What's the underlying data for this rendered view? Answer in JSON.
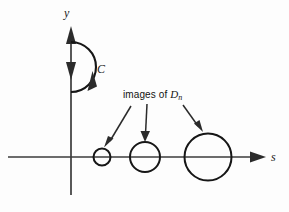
{
  "figure": {
    "kind": "complex-plane-contour-diagram",
    "background_color": "#fdfdfd",
    "ink_color": "#161616",
    "axes": {
      "vertical_label": "y",
      "horizontal_label": "s",
      "origin": {
        "x": 71,
        "y": 157
      },
      "vertical_extent": {
        "top": 26,
        "bottom": 195
      },
      "horizontal_extent": {
        "left": 8,
        "right": 266
      }
    },
    "contour": {
      "label": "C",
      "description": "closed contour: segment of the y-axis with downward arrow plus right-bulging semicircular arc with upward arrow",
      "arc_top": {
        "x": 71,
        "y": 42
      },
      "arc_bottom": {
        "x": 71,
        "y": 92
      },
      "arc_rightmost_x": 95
    },
    "annotation": {
      "text_prefix": "images of ",
      "variable": "D",
      "subscript": "n",
      "full_text": "images of Dn",
      "leaders": [
        {
          "from": {
            "x": 131,
            "y": 106
          },
          "to": {
            "x": 107,
            "y": 146
          }
        },
        {
          "from": {
            "x": 147,
            "y": 104
          },
          "to": {
            "x": 145,
            "y": 140
          }
        },
        {
          "from": {
            "x": 183,
            "y": 105
          },
          "to": {
            "x": 202,
            "y": 131
          }
        }
      ]
    },
    "image_circles": [
      {
        "name": "small-image-circle",
        "cx": 102,
        "cy": 157,
        "r": 8.5
      },
      {
        "name": "medium-image-circle",
        "cx": 145,
        "cy": 157,
        "r": 15.0
      },
      {
        "name": "large-image-circle",
        "cx": 208,
        "cy": 157,
        "r": 23.5
      }
    ]
  }
}
